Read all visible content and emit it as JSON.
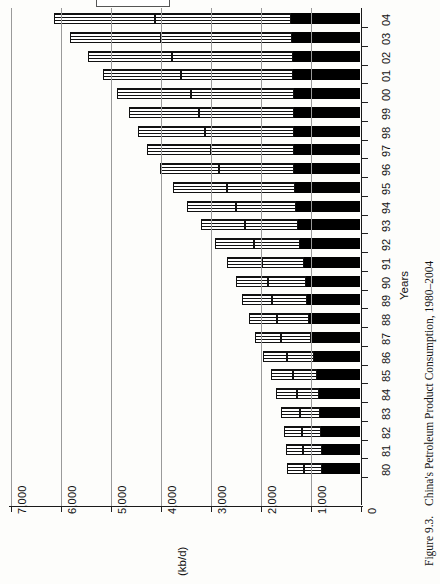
{
  "figure": {
    "number": "Figure 9.3.",
    "title": "China's Petroleum Product Consumption, 1980–2004"
  },
  "chart_data": {
    "type": "bar",
    "orientation": "horizontal-rotated",
    "title": "China's Petroleum Product Consumption, 1980–2004",
    "xlabel": "Years",
    "ylabel": "(kb/d)",
    "ylim": [
      0,
      7000
    ],
    "yticks": [
      0,
      1000,
      2000,
      3000,
      4000,
      5000,
      6000,
      7000
    ],
    "ytick_labels": [
      "0",
      "1,000",
      "2,000",
      "3,000",
      "4,000",
      "5,000",
      "6,000",
      "7,000"
    ],
    "grid": true,
    "legend_position": "top",
    "categories": [
      "80",
      "81",
      "82",
      "83",
      "84",
      "85",
      "86",
      "87",
      "88",
      "89",
      "90",
      "91",
      "92",
      "93",
      "94",
      "95",
      "96",
      "97",
      "98",
      "99",
      "00",
      "01",
      "02",
      "03",
      "04"
    ],
    "stacked": true,
    "series": [
      {
        "name": "segment-black",
        "pattern": "solid-black",
        "values": [
          760,
          770,
          780,
          800,
          830,
          870,
          930,
          980,
          1020,
          1060,
          1090,
          1130,
          1200,
          1250,
          1280,
          1300,
          1320,
          1330,
          1320,
          1320,
          1330,
          1340,
          1350,
          1370,
          1380
        ]
      },
      {
        "name": "segment-lined",
        "pattern": "horizontal-lines",
        "values": [
          360,
          370,
          380,
          400,
          440,
          480,
          540,
          600,
          640,
          700,
          760,
          830,
          930,
          1060,
          1200,
          1360,
          1500,
          1660,
          1780,
          1900,
          2060,
          2240,
          2420,
          2620,
          2720
        ]
      },
      {
        "name": "segment-grid",
        "pattern": "cross-hatch-grid",
        "values": [
          340,
          350,
          360,
          380,
          410,
          440,
          480,
          520,
          560,
          600,
          640,
          700,
          780,
          880,
          980,
          1080,
          1180,
          1280,
          1340,
          1400,
          1480,
          1560,
          1680,
          1820,
          2020
        ]
      }
    ],
    "totals": [
      1460,
      1490,
      1520,
      1580,
      1680,
      1790,
      1950,
      2100,
      2220,
      2360,
      2490,
      2660,
      2910,
      3190,
      3460,
      3740,
      4000,
      4270,
      4440,
      4620,
      4870,
      5140,
      5450,
      5810,
      6120
    ]
  }
}
